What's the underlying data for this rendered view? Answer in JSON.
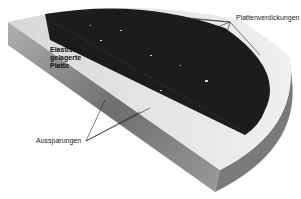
{
  "figure": {
    "type": "3D cutaway diagram of a half-disc plate",
    "labels": {
      "top_right": "Plattenverdickungen",
      "bottom_left": "Aussparungen",
      "inner_line1": "Elastisch",
      "inner_line2": "gelagerte",
      "inner_line3": "Platte"
    },
    "colors": {
      "plate_top": "#1a1a1a",
      "rim": "#e6e6e6",
      "side": "#8a8a8a",
      "leader": "#222222"
    }
  }
}
